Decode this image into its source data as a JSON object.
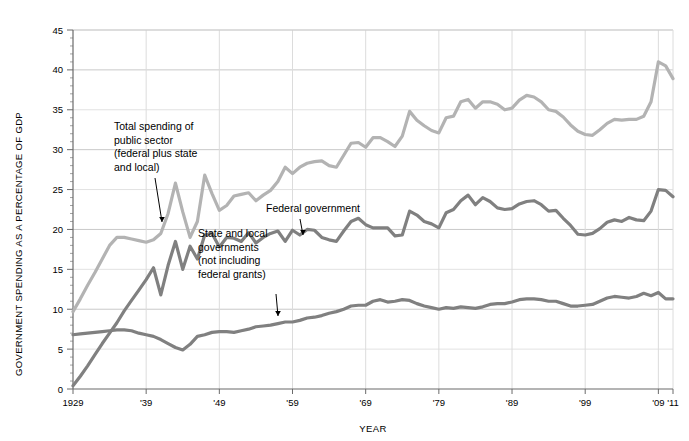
{
  "chart_data": {
    "type": "line",
    "title": "",
    "xlabel": "YEAR",
    "ylabel": "GOVERNMENT SPENDING AS A PERCENTAGE OF GDP",
    "xlim": [
      1929,
      2011
    ],
    "ylim": [
      0,
      45
    ],
    "ytick_step": 5,
    "yticks": [
      0,
      5,
      10,
      15,
      20,
      25,
      30,
      35,
      40,
      45
    ],
    "ytick_labels": [
      "0",
      "5",
      "10",
      "15",
      "20",
      "25",
      "30",
      "35",
      "40",
      "45"
    ],
    "xticks": [
      1929,
      1939,
      1949,
      1959,
      1969,
      1979,
      1989,
      1999,
      2009,
      2011
    ],
    "xtick_labels": [
      "1929",
      "'39",
      "'49",
      "'59",
      "'69",
      "'79",
      "'89",
      "'99",
      "'09",
      "'11"
    ],
    "grid": "horizontal-major",
    "legend_position": "inline-annotations",
    "minor_tick_step": 1,
    "x": [
      1929,
      1930,
      1931,
      1932,
      1933,
      1934,
      1935,
      1936,
      1937,
      1938,
      1939,
      1940,
      1941,
      1942,
      1943,
      1944,
      1945,
      1946,
      1947,
      1948,
      1949,
      1950,
      1951,
      1952,
      1953,
      1954,
      1955,
      1956,
      1957,
      1958,
      1959,
      1960,
      1961,
      1962,
      1963,
      1964,
      1965,
      1966,
      1967,
      1968,
      1969,
      1970,
      1971,
      1972,
      1973,
      1974,
      1975,
      1976,
      1977,
      1978,
      1979,
      1980,
      1981,
      1982,
      1983,
      1984,
      1985,
      1986,
      1987,
      1988,
      1989,
      1990,
      1991,
      1992,
      1993,
      1994,
      1995,
      1996,
      1997,
      1998,
      1999,
      2000,
      2001,
      2002,
      2003,
      2004,
      2005,
      2006,
      2007,
      2008,
      2009,
      2010,
      2011
    ],
    "series": [
      {
        "name": "Total spending of public sector (federal plus state and local)",
        "color": "#b3b3b3",
        "values": [
          9.7,
          11.3,
          13.0,
          14.6,
          16.3,
          18.0,
          19.0,
          19.0,
          18.8,
          18.6,
          18.4,
          18.7,
          19.5,
          22.0,
          25.8,
          22.2,
          19.0,
          21.0,
          26.8,
          24.5,
          22.4,
          23.0,
          24.2,
          24.4,
          24.6,
          23.6,
          24.3,
          24.9,
          26.0,
          27.8,
          27.0,
          27.8,
          28.3,
          28.5,
          28.6,
          28.0,
          27.8,
          29.3,
          30.8,
          30.9,
          30.3,
          31.5,
          31.5,
          31.0,
          30.4,
          31.7,
          34.8,
          33.7,
          33.0,
          32.4,
          32.1,
          34.0,
          34.2,
          36.0,
          36.3,
          35.2,
          36.0,
          36.0,
          35.7,
          35.0,
          35.2,
          36.2,
          36.8,
          36.6,
          36.0,
          35.0,
          34.8,
          34.1,
          33.1,
          32.3,
          31.9,
          31.8,
          32.5,
          33.3,
          33.8,
          33.7,
          33.8,
          33.8,
          34.2,
          36.0,
          41.0,
          40.5,
          38.9
        ]
      },
      {
        "name": "Federal government",
        "color": "#808080",
        "values": [
          0.4,
          1.6,
          2.9,
          4.3,
          5.7,
          7.0,
          8.3,
          9.8,
          11.1,
          12.4,
          13.7,
          15.2,
          11.8,
          15.5,
          18.5,
          15.0,
          17.9,
          16.3,
          19.3,
          19.5,
          17.8,
          19.0,
          18.9,
          18.5,
          19.6,
          18.3,
          19.0,
          19.5,
          19.8,
          18.5,
          19.9,
          19.3,
          20.0,
          19.9,
          19.0,
          18.7,
          18.5,
          19.8,
          21.0,
          21.4,
          20.6,
          20.2,
          20.2,
          20.2,
          19.2,
          19.3,
          22.3,
          21.8,
          21.0,
          20.7,
          20.2,
          22.1,
          22.5,
          23.6,
          24.3,
          23.1,
          24.0,
          23.5,
          22.7,
          22.5,
          22.6,
          23.2,
          23.5,
          23.6,
          23.1,
          22.3,
          22.4,
          21.4,
          20.5,
          19.4,
          19.3,
          19.5,
          20.1,
          20.9,
          21.2,
          21.0,
          21.5,
          21.2,
          21.1,
          22.3,
          25.0,
          24.9,
          24.1
        ]
      },
      {
        "name": "State and local governments (not including federal grants)",
        "color": "#808080",
        "values": [
          6.8,
          6.9,
          7.0,
          7.1,
          7.2,
          7.3,
          7.4,
          7.4,
          7.3,
          7.0,
          6.8,
          6.6,
          6.2,
          5.7,
          5.2,
          4.9,
          5.6,
          6.6,
          6.8,
          7.1,
          7.2,
          7.2,
          7.1,
          7.3,
          7.5,
          7.8,
          7.9,
          8.0,
          8.2,
          8.4,
          8.4,
          8.6,
          8.9,
          9.0,
          9.2,
          9.5,
          9.7,
          10.0,
          10.4,
          10.5,
          10.5,
          11.0,
          11.2,
          10.9,
          11.0,
          11.2,
          11.1,
          10.7,
          10.4,
          10.2,
          10.0,
          10.2,
          10.1,
          10.3,
          10.2,
          10.1,
          10.3,
          10.6,
          10.7,
          10.7,
          10.9,
          11.2,
          11.3,
          11.3,
          11.2,
          11.0,
          11.0,
          10.7,
          10.4,
          10.4,
          10.5,
          10.6,
          11.0,
          11.4,
          11.6,
          11.5,
          11.4,
          11.6,
          12.0,
          11.7,
          12.1,
          11.3,
          11.3
        ]
      }
    ],
    "annotations": [
      {
        "id": "total-spending",
        "lines": [
          "Total spending of",
          "public sector",
          "(federal plus state",
          "and local)"
        ],
        "text_x": 114,
        "text_y": 130,
        "arrow_from_x": 155,
        "arrow_from_y": 178,
        "arrow_to_x": 162,
        "arrow_to_y": 222
      },
      {
        "id": "federal-government",
        "lines": [
          "Federal government"
        ],
        "text_x": 266,
        "text_y": 212,
        "arrow_from_x": 300,
        "arrow_from_y": 219,
        "arrow_to_x": 303,
        "arrow_to_y": 235
      },
      {
        "id": "state-and-local",
        "lines": [
          "State and local",
          "governments",
          "(not including",
          "federal grants)"
        ],
        "text_x": 198,
        "text_y": 237,
        "arrow_from_x": 276,
        "arrow_from_y": 294,
        "arrow_to_x": 278,
        "arrow_to_y": 316
      }
    ]
  }
}
